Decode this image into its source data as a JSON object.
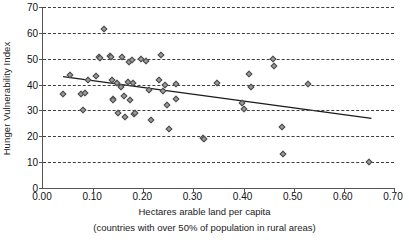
{
  "chart_data": {
    "type": "scatter",
    "title": "",
    "xlabel": "Hectares arable land per capita",
    "xsublabel": "(countries with over 50% of population in rural areas)",
    "ylabel": "Hunger Vulnerability Index",
    "xlim": [
      0.0,
      0.7
    ],
    "ylim": [
      0,
      70
    ],
    "xticks": [
      "0.00",
      "0.10",
      "0.20",
      "0.30",
      "0.40",
      "0.50",
      "0.60",
      "0.70"
    ],
    "xtick_values": [
      0.0,
      0.1,
      0.2,
      0.3,
      0.4,
      0.5,
      0.6,
      0.7
    ],
    "yticks": [
      "0",
      "10",
      "20",
      "30",
      "40",
      "50",
      "60",
      "70"
    ],
    "ytick_values": [
      0,
      10,
      20,
      30,
      40,
      50,
      60,
      70
    ],
    "grid": "horizontal-dashed",
    "legend": "none",
    "marker": "diamond",
    "marker_color": "#9b9b9b",
    "marker_edge_color": "#4a4a4a",
    "line_color": "#1a1a1a",
    "points": [
      {
        "x": 0.04,
        "y": 36.2
      },
      {
        "x": 0.053,
        "y": 43.8
      },
      {
        "x": 0.075,
        "y": 36.4
      },
      {
        "x": 0.08,
        "y": 30.1
      },
      {
        "x": 0.083,
        "y": 36.7
      },
      {
        "x": 0.089,
        "y": 41.9
      },
      {
        "x": 0.105,
        "y": 43.2
      },
      {
        "x": 0.112,
        "y": 50.6
      },
      {
        "x": 0.114,
        "y": 50.3
      },
      {
        "x": 0.122,
        "y": 61.5
      },
      {
        "x": 0.133,
        "y": 51.0
      },
      {
        "x": 0.136,
        "y": 50.8
      },
      {
        "x": 0.137,
        "y": 41.9
      },
      {
        "x": 0.139,
        "y": 34.6
      },
      {
        "x": 0.14,
        "y": 34.2
      },
      {
        "x": 0.147,
        "y": 40.7
      },
      {
        "x": 0.15,
        "y": 28.9
      },
      {
        "x": 0.155,
        "y": 39.2
      },
      {
        "x": 0.158,
        "y": 50.7
      },
      {
        "x": 0.162,
        "y": 35.6
      },
      {
        "x": 0.163,
        "y": 27.4
      },
      {
        "x": 0.169,
        "y": 41.0
      },
      {
        "x": 0.171,
        "y": 48.8
      },
      {
        "x": 0.173,
        "y": 34.1
      },
      {
        "x": 0.177,
        "y": 49.6
      },
      {
        "x": 0.179,
        "y": 40.6
      },
      {
        "x": 0.181,
        "y": 28.8
      },
      {
        "x": 0.184,
        "y": 29.0
      },
      {
        "x": 0.196,
        "y": 49.8
      },
      {
        "x": 0.206,
        "y": 49.0
      },
      {
        "x": 0.211,
        "y": 37.9
      },
      {
        "x": 0.216,
        "y": 26.4
      },
      {
        "x": 0.232,
        "y": 41.9
      },
      {
        "x": 0.236,
        "y": 51.6
      },
      {
        "x": 0.24,
        "y": 37.7
      },
      {
        "x": 0.243,
        "y": 40.0
      },
      {
        "x": 0.248,
        "y": 32.0
      },
      {
        "x": 0.251,
        "y": 22.8
      },
      {
        "x": 0.265,
        "y": 40.2
      },
      {
        "x": 0.266,
        "y": 34.6
      },
      {
        "x": 0.32,
        "y": 19.4
      },
      {
        "x": 0.321,
        "y": 18.9
      },
      {
        "x": 0.347,
        "y": 40.6
      },
      {
        "x": 0.397,
        "y": 33.0
      },
      {
        "x": 0.4,
        "y": 30.7
      },
      {
        "x": 0.41,
        "y": 44.2
      },
      {
        "x": 0.414,
        "y": 39.2
      },
      {
        "x": 0.458,
        "y": 49.7
      },
      {
        "x": 0.461,
        "y": 47.0
      },
      {
        "x": 0.476,
        "y": 23.6
      },
      {
        "x": 0.479,
        "y": 13.2
      },
      {
        "x": 0.528,
        "y": 40.2
      },
      {
        "x": 0.65,
        "y": 10.0
      }
    ],
    "trendline": {
      "x_start": 0.04,
      "y_start": 43.1,
      "x_end": 0.655,
      "y_end": 26.9
    }
  }
}
